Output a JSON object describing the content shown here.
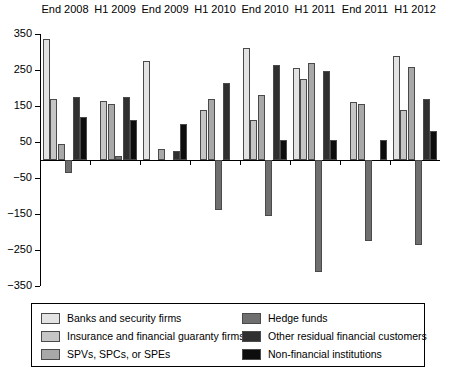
{
  "chart_data": {
    "type": "bar",
    "title": "",
    "subtitle": "",
    "xlabel": "",
    "ylabel": "",
    "ylim": [
      -350,
      350
    ],
    "yticks": [
      350,
      250,
      150,
      50,
      -50,
      -150,
      -250,
      -350
    ],
    "ytick_labels": [
      "350",
      "250",
      "150",
      "50",
      "−50",
      "−150",
      "−250",
      "−350"
    ],
    "grid": false,
    "legend_position": "bottom",
    "categories": [
      "End 2008",
      "H1 2009",
      "End 2009",
      "H1 2010",
      "End 2010",
      "H1 2011",
      "End 2011",
      "H1 2012"
    ],
    "series": [
      {
        "name": "Banks and security firms",
        "color": "#e3e3e3",
        "values": [
          335,
          0,
          275,
          0,
          310,
          255,
          0,
          290
        ]
      },
      {
        "name": "Insurance and financial guaranty firms",
        "color": "#c6c6c6",
        "values": [
          170,
          165,
          0,
          140,
          110,
          225,
          160,
          140
        ]
      },
      {
        "name": "SPVs, SPCs, or SPEs",
        "color": "#a8a8a8",
        "values": [
          45,
          155,
          30,
          170,
          180,
          270,
          155,
          258
        ]
      },
      {
        "name": "Hedge funds",
        "color": "#6f6f6f",
        "values": [
          -35,
          10,
          0,
          -140,
          -155,
          -310,
          -225,
          -235
        ]
      },
      {
        "name": "Other residual financial customers",
        "color": "#303030",
        "values": [
          175,
          175,
          25,
          215,
          265,
          248,
          0,
          170
        ]
      },
      {
        "name": "Non-financial institutions",
        "color": "#0d0d0d",
        "values": [
          120,
          110,
          100,
          0,
          55,
          55,
          55,
          80
        ]
      }
    ]
  },
  "legend": {
    "items": [
      {
        "label": "Banks and security firms",
        "color": "#e3e3e3"
      },
      {
        "label": "Insurance and financial guaranty firms",
        "color": "#c6c6c6"
      },
      {
        "label": "SPVs, SPCs, or SPEs",
        "color": "#a8a8a8"
      },
      {
        "label": "Hedge funds",
        "color": "#6f6f6f"
      },
      {
        "label": "Other residual financial customers",
        "color": "#303030"
      },
      {
        "label": "Non-financial institutions",
        "color": "#0d0d0d"
      }
    ]
  }
}
